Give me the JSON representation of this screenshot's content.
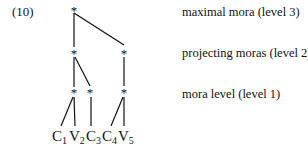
{
  "example_number": "(10)",
  "tree": {
    "node_symbol": "*",
    "levels": [
      {
        "label": "maximal mora (level 3)"
      },
      {
        "label": "projecting moras (level 2)"
      },
      {
        "label": "mora level (level 1)"
      }
    ],
    "segments": [
      {
        "letter": "C",
        "index": "1"
      },
      {
        "letter": "V",
        "index": "2"
      },
      {
        "letter": "C",
        "index": "3"
      },
      {
        "letter": "C",
        "index": "4"
      },
      {
        "letter": "V",
        "index": "5"
      }
    ]
  }
}
